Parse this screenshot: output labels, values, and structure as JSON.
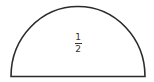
{
  "shape": {
    "type": "semicircle",
    "stroke_color": "#2b2b2b",
    "fill_color": "#ffffff"
  },
  "label": {
    "numerator": "1",
    "denominator": "2"
  }
}
